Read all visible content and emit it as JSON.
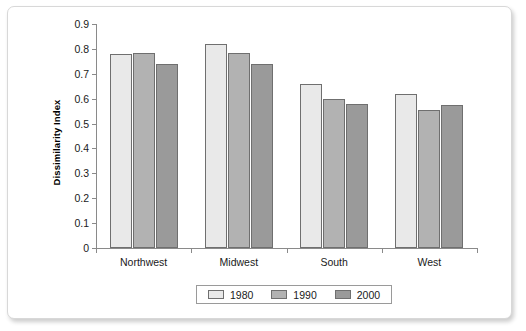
{
  "chart_data": {
    "type": "bar",
    "title": "",
    "xlabel": "",
    "ylabel": "Dissimilarity Index",
    "categories": [
      "Northwest",
      "Midwest",
      "South",
      "West"
    ],
    "series": [
      {
        "name": "1980",
        "color": "#e9e9e9",
        "values": [
          0.78,
          0.82,
          0.66,
          0.62
        ]
      },
      {
        "name": "1990",
        "color": "#b2b2b2",
        "values": [
          0.785,
          0.785,
          0.6,
          0.555
        ]
      },
      {
        "name": "2000",
        "color": "#9a9a9a",
        "values": [
          0.74,
          0.74,
          0.58,
          0.575
        ]
      }
    ],
    "ylim": [
      0,
      0.9
    ],
    "ytick_values": [
      0,
      0.1,
      0.2,
      0.3,
      0.4,
      0.5,
      0.6,
      0.7,
      0.8,
      0.9
    ],
    "ytick_labels": [
      "0",
      "0.1",
      "0.2",
      "0.3",
      "0.4",
      "0.5",
      "0.6",
      "0.7",
      "0.8",
      "0.9"
    ],
    "grid": false,
    "legend_position": "bottom",
    "legend_entries": [
      "1980",
      "1990",
      "2000"
    ],
    "bar_border_color": "#6f6f6f",
    "axis_color": "#8a8a8a",
    "frame_border_color": "#d8d8d8",
    "background_color": "#ffffff"
  }
}
